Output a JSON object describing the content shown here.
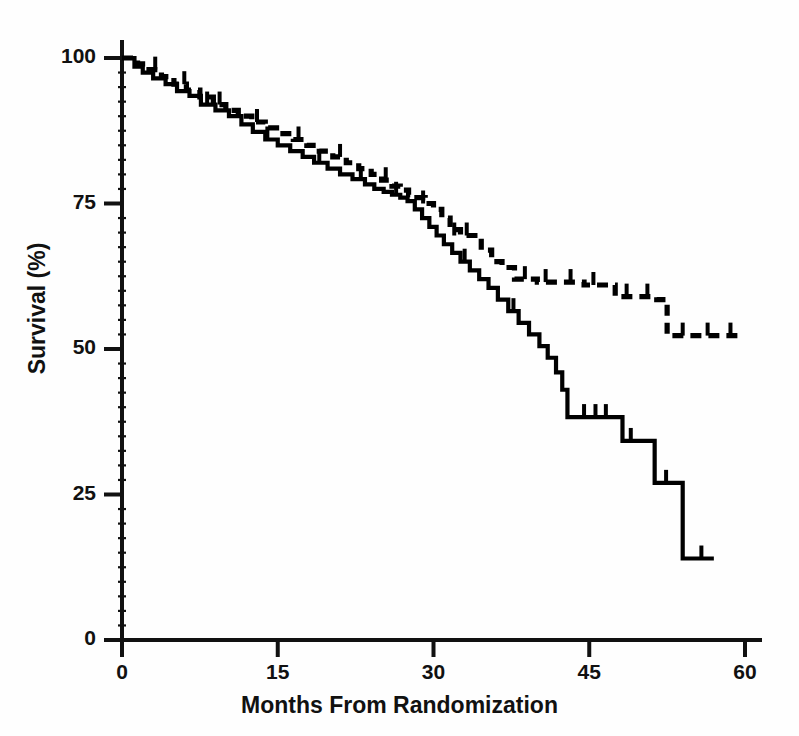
{
  "chart_data": {
    "type": "line",
    "subtype": "kaplan-meier-step",
    "title": "",
    "xlabel": "Months From Randomization",
    "ylabel": "Survival (%)",
    "xlim": [
      0,
      62
    ],
    "ylim": [
      0,
      100
    ],
    "xticks": [
      0,
      15,
      30,
      45,
      60
    ],
    "xtick_labels": [
      "0",
      "15",
      "30",
      "45",
      "60"
    ],
    "yticks": [
      0,
      25,
      50,
      75,
      100
    ],
    "ytick_labels": [
      "0",
      "25",
      "50",
      "75",
      "100"
    ],
    "grid": false,
    "legend": "none",
    "minor_ticks_y": true,
    "series": [
      {
        "name": "solid-curve",
        "style": "solid",
        "color": "#000000",
        "censor_marks": true,
        "points": [
          [
            0,
            100
          ],
          [
            1.2,
            98.5
          ],
          [
            2.0,
            97.5
          ],
          [
            3.0,
            96.5
          ],
          [
            4.2,
            95.5
          ],
          [
            5.3,
            94.3
          ],
          [
            6.5,
            93.5
          ],
          [
            7.6,
            92.0
          ],
          [
            9.0,
            91.0
          ],
          [
            10.3,
            90.0
          ],
          [
            11.5,
            88.6
          ],
          [
            12.6,
            87.3
          ],
          [
            13.8,
            86.0
          ],
          [
            15.0,
            85.0
          ],
          [
            16.2,
            84.0
          ],
          [
            17.4,
            83.0
          ],
          [
            18.5,
            82.0
          ],
          [
            19.8,
            81.0
          ],
          [
            21.0,
            80.0
          ],
          [
            22.2,
            79.2
          ],
          [
            23.4,
            78.3
          ],
          [
            24.3,
            77.5
          ],
          [
            25.2,
            77.0
          ],
          [
            26.0,
            76.5
          ],
          [
            26.8,
            76.0
          ],
          [
            27.5,
            75.4
          ],
          [
            28.2,
            74.0
          ],
          [
            28.9,
            72.5
          ],
          [
            29.6,
            71.0
          ],
          [
            30.3,
            69.5
          ],
          [
            31.0,
            68.0
          ],
          [
            31.8,
            66.5
          ],
          [
            32.6,
            65.0
          ],
          [
            33.5,
            63.5
          ],
          [
            34.4,
            62.0
          ],
          [
            35.3,
            60.5
          ],
          [
            36.2,
            58.5
          ],
          [
            37.2,
            56.5
          ],
          [
            38.2,
            54.5
          ],
          [
            39.2,
            52.5
          ],
          [
            40.2,
            50.5
          ],
          [
            41.0,
            48.5
          ],
          [
            41.8,
            46.0
          ],
          [
            42.4,
            43.0
          ],
          [
            42.9,
            38.3
          ],
          [
            47.5,
            38.3
          ],
          [
            48.2,
            34.2
          ],
          [
            50.5,
            34.2
          ],
          [
            51.3,
            27.0
          ],
          [
            54.0,
            27.0
          ],
          [
            54.0,
            14.0
          ],
          [
            57.0,
            14.0
          ]
        ],
        "final_value": 14.0
      },
      {
        "name": "dashed-curve",
        "style": "dashed",
        "color": "#000000",
        "censor_marks": true,
        "points": [
          [
            0,
            100
          ],
          [
            1.5,
            99.0
          ],
          [
            2.6,
            98.0
          ],
          [
            3.8,
            96.8
          ],
          [
            5.0,
            95.5
          ],
          [
            6.2,
            94.5
          ],
          [
            7.5,
            93.3
          ],
          [
            8.8,
            92.0
          ],
          [
            10.0,
            91.0
          ],
          [
            11.2,
            90.0
          ],
          [
            12.5,
            89.0
          ],
          [
            13.8,
            88.0
          ],
          [
            15.2,
            87.0
          ],
          [
            16.5,
            86.0
          ],
          [
            17.8,
            85.0
          ],
          [
            19.0,
            84.0
          ],
          [
            20.3,
            83.0
          ],
          [
            21.6,
            82.0
          ],
          [
            22.8,
            81.0
          ],
          [
            24.0,
            80.0
          ],
          [
            25.0,
            79.0
          ],
          [
            26.0,
            78.0
          ],
          [
            26.8,
            77.3
          ],
          [
            27.6,
            76.5
          ],
          [
            28.4,
            76.0
          ],
          [
            29.2,
            75.0
          ],
          [
            30.0,
            74.0
          ],
          [
            30.8,
            72.5
          ],
          [
            31.6,
            70.5
          ],
          [
            32.6,
            69.5
          ],
          [
            33.8,
            69.5
          ],
          [
            34.6,
            67.0
          ],
          [
            35.6,
            65.0
          ],
          [
            36.6,
            64.0
          ],
          [
            37.8,
            62.0
          ],
          [
            40.0,
            61.5
          ],
          [
            42.0,
            61.5
          ],
          [
            44.5,
            61.0
          ],
          [
            46.5,
            61.0
          ],
          [
            47.5,
            59.0
          ],
          [
            50.0,
            59.0
          ],
          [
            51.5,
            58.5
          ],
          [
            52.5,
            52.3
          ],
          [
            56.0,
            52.3
          ],
          [
            59.5,
            52.3
          ]
        ],
        "final_value": 52.3
      }
    ]
  },
  "axes": {
    "x_title": "Months From Randomization",
    "y_title": "Survival (%)",
    "x_tick_labels": [
      "0",
      "15",
      "30",
      "45",
      "60"
    ],
    "y_tick_labels": [
      "0",
      "25",
      "50",
      "75",
      "100"
    ]
  },
  "colors": {
    "line": "#000000",
    "axis": "#111111",
    "background": "#ffffff"
  }
}
